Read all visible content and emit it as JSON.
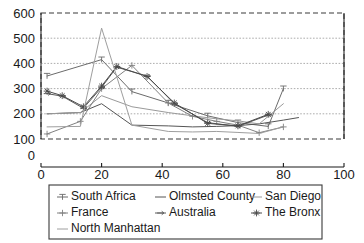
{
  "chart_data": {
    "type": "line",
    "title": "",
    "xlabel": "",
    "ylabel": "",
    "xlim": [
      0,
      100
    ],
    "ylim": [
      100,
      600
    ],
    "grid": true,
    "legend_position": "bottom",
    "x_ticks": [
      "0",
      "20",
      "40",
      "60",
      "80",
      "100"
    ],
    "y_ticks": [
      "100",
      "200",
      "300",
      "400",
      "500",
      "600"
    ],
    "stray_origin_label": "0",
    "series": [
      {
        "name": "South Africa",
        "color": "#6b6b6b",
        "marker": "tee",
        "x": [
          2,
          20,
          30,
          42,
          55,
          65,
          75,
          80
        ],
        "y": [
          350,
          415,
          288,
          243,
          192,
          165,
          150,
          300
        ]
      },
      {
        "name": "Olmsted County",
        "color": "#555555",
        "marker": "none",
        "x": [
          2,
          13,
          20,
          30,
          42,
          50,
          58,
          65,
          72,
          80,
          85
        ],
        "y": [
          200,
          205,
          240,
          155,
          152,
          148,
          150,
          153,
          160,
          175,
          185
        ]
      },
      {
        "name": "San Diego",
        "color": "#9a9a9a",
        "marker": "none",
        "x": [
          2,
          13,
          20,
          30,
          42,
          50,
          58,
          65,
          72,
          80
        ],
        "y": [
          200,
          205,
          272,
          228,
          205,
          192,
          180,
          172,
          160,
          240
        ]
      },
      {
        "name": "France",
        "color": "#808080",
        "marker": "plus",
        "x": [
          2,
          13,
          20,
          30,
          42,
          50,
          58,
          65,
          72,
          80
        ],
        "y": [
          120,
          170,
          300,
          392,
          243,
          190,
          170,
          155,
          125,
          148
        ]
      },
      {
        "name": "Australia",
        "color": "#5a5a5a",
        "marker": "arrow",
        "x": [
          2,
          7,
          14,
          20,
          25,
          35,
          44,
          55,
          65,
          75
        ],
        "y": [
          280,
          270,
          222,
          305,
          385,
          350,
          240,
          165,
          150,
          195
        ]
      },
      {
        "name": "The Bronx",
        "color": "#4a4a4a",
        "marker": "star",
        "x": [
          2,
          7,
          14,
          20,
          25,
          35,
          44,
          55,
          65,
          75
        ],
        "y": [
          290,
          272,
          228,
          310,
          388,
          348,
          243,
          162,
          152,
          198
        ]
      },
      {
        "name": "North Manhattan",
        "color": "#9e9e9e",
        "marker": "none",
        "x": [
          2,
          13,
          20,
          30,
          42,
          50,
          58,
          65,
          72,
          80
        ],
        "y": [
          148,
          150,
          540,
          155,
          130,
          128,
          130,
          126,
          122,
          148
        ]
      }
    ]
  },
  "legend": {
    "items": [
      {
        "label": "South Africa",
        "marker": "tee",
        "color": "#6b6b6b"
      },
      {
        "label": "Olmsted County",
        "marker": "none",
        "color": "#555555"
      },
      {
        "label": "San Diego",
        "marker": "none",
        "color": "#9a9a9a"
      },
      {
        "label": "France",
        "marker": "plus",
        "color": "#808080"
      },
      {
        "label": "Australia",
        "marker": "arrow",
        "color": "#5a5a5a"
      },
      {
        "label": "The Bronx",
        "marker": "star",
        "color": "#4a4a4a"
      },
      {
        "label": "North Manhattan",
        "marker": "none",
        "color": "#9e9e9e"
      }
    ]
  }
}
